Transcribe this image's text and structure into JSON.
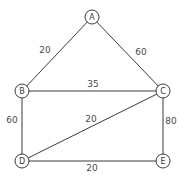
{
  "diagram": {
    "type": "weighted-undirected-graph",
    "colors": {
      "stroke": "#3a3a3a",
      "text": "#4a4a4a",
      "background": "#ffffff"
    },
    "nodes": [
      {
        "id": "A",
        "label": "A",
        "x": 92,
        "y": 17
      },
      {
        "id": "B",
        "label": "B",
        "x": 22,
        "y": 91
      },
      {
        "id": "C",
        "label": "C",
        "x": 163,
        "y": 91
      },
      {
        "id": "D",
        "label": "D",
        "x": 22,
        "y": 161
      },
      {
        "id": "E",
        "label": "E",
        "x": 163,
        "y": 161
      }
    ],
    "edges": [
      {
        "from": "A",
        "to": "B",
        "weight": "20",
        "lx": 45,
        "ly": 50
      },
      {
        "from": "A",
        "to": "C",
        "weight": "60",
        "lx": 141,
        "ly": 52
      },
      {
        "from": "B",
        "to": "C",
        "weight": "35",
        "lx": 93,
        "ly": 84
      },
      {
        "from": "B",
        "to": "D",
        "weight": "60",
        "lx": 12,
        "ly": 120
      },
      {
        "from": "C",
        "to": "D",
        "weight": "20",
        "lx": 91,
        "ly": 119
      },
      {
        "from": "C",
        "to": "E",
        "weight": "80",
        "lx": 171,
        "ly": 121
      },
      {
        "from": "D",
        "to": "E",
        "weight": "20",
        "lx": 92,
        "ly": 168
      }
    ]
  }
}
